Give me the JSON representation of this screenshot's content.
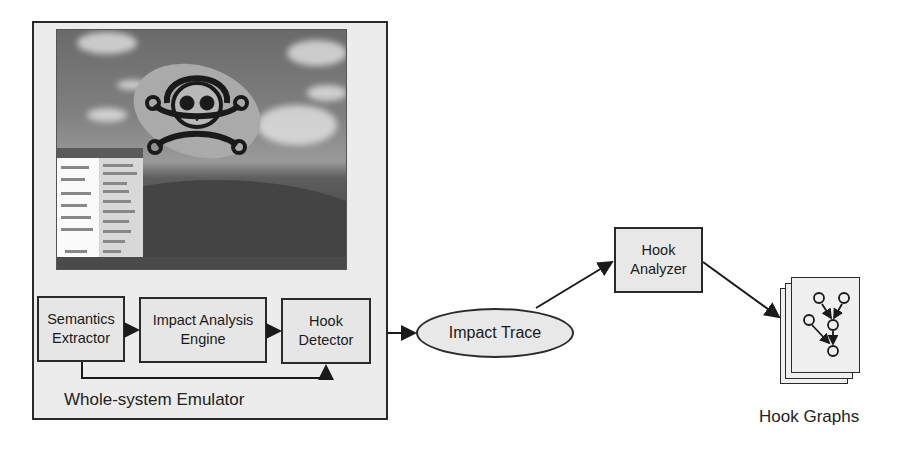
{
  "diagram": {
    "emulator": {
      "label": "Whole-system Emulator",
      "screen_icon": "skull-crossbones-icon",
      "components": [
        {
          "id": "semantics-extractor",
          "line1": "Semantics",
          "line2": "Extractor"
        },
        {
          "id": "impact-analysis-engine",
          "line1": "Impact Analysis",
          "line2": "Engine"
        },
        {
          "id": "hook-detector",
          "line1": "Hook",
          "line2": "Detector"
        }
      ]
    },
    "impact_trace": {
      "label": "Impact Trace"
    },
    "hook_analyzer": {
      "line1": "Hook",
      "line2": "Analyzer"
    },
    "hook_graphs": {
      "label": "Hook Graphs"
    },
    "edges": [
      {
        "from": "Semantics Extractor",
        "to": "Impact Analysis Engine"
      },
      {
        "from": "Impact Analysis Engine",
        "to": "Hook Detector"
      },
      {
        "from": "Semantics Extractor",
        "to": "Hook Detector"
      },
      {
        "from": "Hook Detector",
        "to": "Impact Trace"
      },
      {
        "from": "Impact Trace",
        "to": "Hook Analyzer"
      },
      {
        "from": "Hook Analyzer",
        "to": "Hook Graphs"
      }
    ]
  }
}
